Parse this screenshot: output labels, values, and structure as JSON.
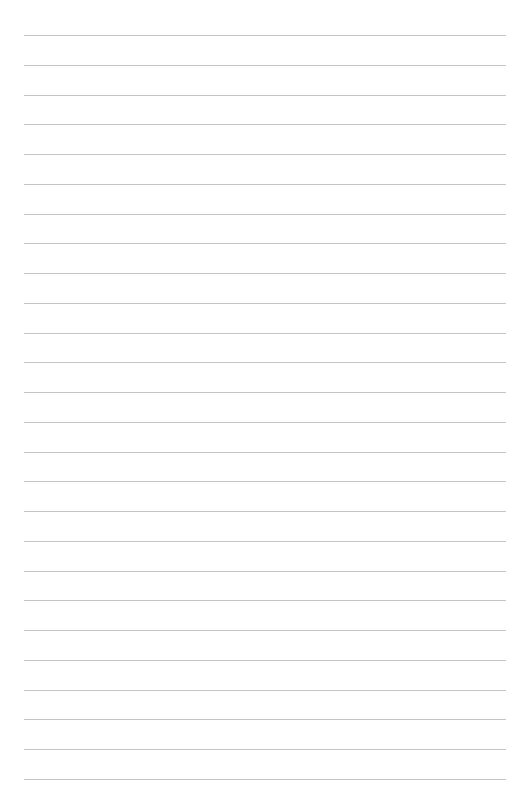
{
  "page": {
    "type": "lined-paper",
    "background_color": "#ffffff",
    "line_color": "#c4c4c4",
    "line_count": 26,
    "first_line_y": 35,
    "line_spacing": 29.75,
    "line_left": 24,
    "line_right": 506
  }
}
